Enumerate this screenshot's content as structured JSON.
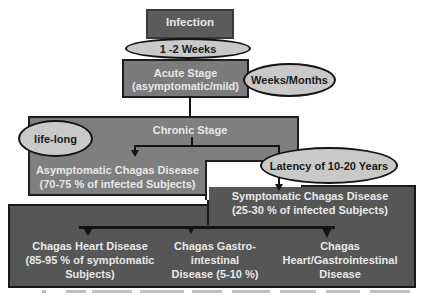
{
  "diagram": {
    "nodes": {
      "infection": "Infection",
      "interval_1": "1 -2 Weeks",
      "acute_line1": "Acute Stage",
      "acute_line2": "(asymptomatic/mild)",
      "acute_duration": "Weeks/Months",
      "chronic": "Chronic Stage",
      "chronic_duration": "life-long",
      "asymptomatic_line1": "Asymptomatic Chagas Disease",
      "asymptomatic_line2": "(70-75 %  of infected Subjects)",
      "latency": "Latency of 10-20 Years",
      "symptomatic_line1": "Symptomatic Chagas Disease",
      "symptomatic_line2": "(25-30 % of infected Subjects)",
      "heart_line1": "Chagas Heart Disease",
      "heart_line2": "(85-95 % of symptomatic",
      "heart_line3": "Subjects)",
      "gi_line1": "Chagas Gastro-",
      "gi_line2": "intestinal",
      "gi_line3": "Disease (5-10 %)",
      "mixed_line1": "Chagas",
      "mixed_line2": "Heart/Gastrointestinal",
      "mixed_line3": "Disease"
    },
    "colors": {
      "infection_box": "#5b5b5b",
      "acute_box": "#7b7b7b",
      "chronic_box": "#7f7f7f",
      "symptomatic_box": "#565656",
      "ellipse_fill": "#c9c9c9",
      "outline": "#141414",
      "box_text": "#e8e8e8"
    }
  }
}
